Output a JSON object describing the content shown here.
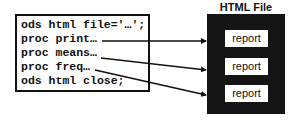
{
  "code_box": {
    "lines": [
      "ods html file='…';",
      "proc print…",
      "proc means…",
      "proc freq…",
      "ods html close;"
    ]
  },
  "html_file": {
    "title": "HTML File",
    "reports": [
      "report",
      "report",
      "report"
    ]
  },
  "colors": {
    "text": "#111111",
    "html_box": "#141414",
    "background": "#ffffff"
  }
}
